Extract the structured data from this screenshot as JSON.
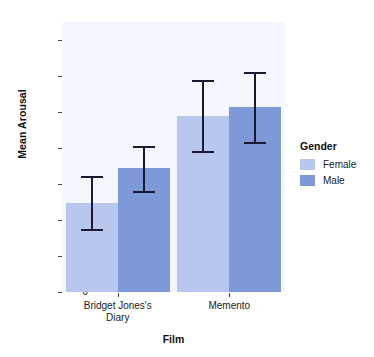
{
  "chart_data": {
    "type": "bar",
    "title": "",
    "xlabel": "Film",
    "ylabel": "Mean Arousal",
    "categories": [
      "Bridget Jones's Diary",
      "Memento"
    ],
    "category_lines": [
      [
        "Bridget Jones's",
        "Diary"
      ],
      [
        "Memento"
      ]
    ],
    "legend_title": "Gender",
    "legend_position": "right",
    "grid": false,
    "ylim": [
      0,
      37.5
    ],
    "yticks": [
      0,
      5,
      10,
      15,
      20,
      25,
      30,
      35
    ],
    "ytick_labels": [
      "0",
      "5",
      "10",
      "15",
      "20",
      "25",
      "30",
      "35"
    ],
    "series": [
      {
        "name": "Female",
        "color": "#b8c7ee",
        "values": [
          12.3,
          24.4
        ],
        "error_upper": [
          16.1,
          29.4
        ],
        "error_lower": [
          8.5,
          19.3
        ]
      },
      {
        "name": "Male",
        "color": "#7e99d8",
        "values": [
          17.2,
          25.7
        ],
        "error_upper": [
          20.3,
          30.6
        ],
        "error_lower": [
          13.8,
          20.5
        ]
      }
    ],
    "panel_background": "#f4f7fd",
    "errorbar_color": "#191933"
  }
}
